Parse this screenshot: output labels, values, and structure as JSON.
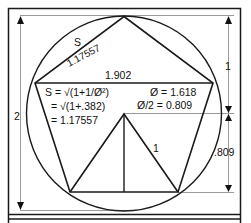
{
  "diagram": {
    "colors": {
      "stroke": "#1a1a1a",
      "guide": "#9a9a9a",
      "background": "#ffffff"
    },
    "labels": {
      "side_letter": "S",
      "side_value": "1.17557",
      "diagonal": "1.902",
      "formula_line1": "S = √(1+1/Ø²)",
      "formula_line2": "= √(1+.382)",
      "formula_line3": "= 1.17557",
      "phi": "Ø = 1.618",
      "phi_half": "Ø/2 = 0.809",
      "triangle_side": "1",
      "dim_left": "2",
      "dim_right_top": "1",
      "dim_right_bottom": ".809"
    }
  }
}
